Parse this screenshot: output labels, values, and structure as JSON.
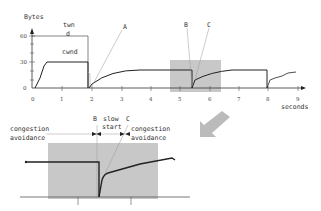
{
  "top_chart": {
    "y_axis_label": "Bytes",
    "y_ticks": [
      "60",
      "30",
      "0"
    ],
    "x_ticks": [
      "0",
      "1",
      "2",
      "3",
      "4",
      "5",
      "6",
      "7",
      "8",
      "9"
    ],
    "x_axis_label": "seconds",
    "twnd_label_line1": "twn",
    "twnd_label_line2": "d",
    "cwnd_label": "cwnd",
    "marker_A": "A",
    "marker_B": "B",
    "marker_C": "C"
  },
  "bottom_chart": {
    "marker_B": "B",
    "marker_C": "C",
    "slow_start_line1": "slow",
    "slow_start_line2": "start",
    "left_phase_line1": "congestion",
    "left_phase_line2": "avoidance",
    "right_phase_line1": "congestion",
    "right_phase_line2": "avoidance"
  },
  "colors": {
    "highlight": "#c8c8c8",
    "line": "#222222",
    "guide": "#999999",
    "arrow": "#bbbbbb"
  }
}
